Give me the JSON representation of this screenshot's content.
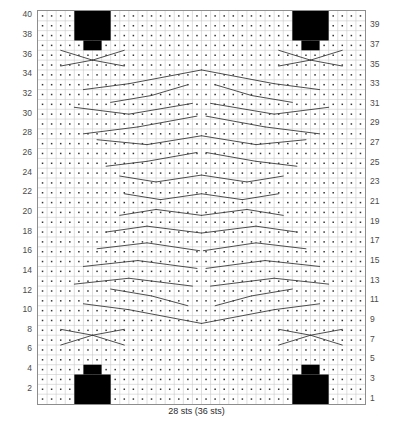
{
  "chart_data": {
    "type": "table",
    "caption": "28 sts (36 sts)",
    "columns": 36,
    "rows": 40,
    "grid": true,
    "xlabel": "",
    "ylabel": "",
    "cell_symbol": "purl-dot",
    "row_numbers_left": [
      40,
      38,
      36,
      34,
      32,
      30,
      28,
      26,
      24,
      22,
      20,
      18,
      16,
      14,
      12,
      10,
      8,
      6,
      4,
      2
    ],
    "row_numbers_right": [
      39,
      37,
      35,
      33,
      31,
      29,
      27,
      25,
      23,
      21,
      19,
      17,
      15,
      13,
      11,
      9,
      7,
      5,
      3,
      1
    ],
    "legend": [],
    "colors": {
      "grid_line": "#c9c9c9",
      "grid_border": "#8d8d8d",
      "dot": "#333333",
      "cable_line": "#3a3a3a",
      "block_fill": "#000000",
      "number_text": "#4a4a4a"
    },
    "blocks": [
      {
        "name": "top-left-bobble",
        "col": 4,
        "row": 37,
        "w": 4,
        "h": 3,
        "stem_col": 5,
        "stem_w": 2,
        "stem_h": 1,
        "orientation": "down"
      },
      {
        "name": "top-right-bobble",
        "col": 28,
        "row": 37,
        "w": 4,
        "h": 3,
        "stem_col": 29,
        "stem_w": 2,
        "stem_h": 1,
        "orientation": "down"
      },
      {
        "name": "bottom-left-bobble",
        "col": 4,
        "row": 1,
        "w": 4,
        "h": 3,
        "stem_col": 5,
        "stem_w": 2,
        "stem_h": 1,
        "orientation": "up"
      },
      {
        "name": "bottom-right-bobble",
        "col": 28,
        "row": 1,
        "w": 4,
        "h": 3,
        "stem_col": 29,
        "stem_w": 2,
        "stem_h": 1,
        "orientation": "up"
      }
    ],
    "cable_lines": [
      {
        "x1": 6.0,
        "y1": 36.0,
        "x2": 2.5,
        "y2": 37.0
      },
      {
        "x1": 6.0,
        "y1": 36.0,
        "x2": 9.5,
        "y2": 37.0
      },
      {
        "x1": 6.0,
        "y1": 36.0,
        "x2": 2.5,
        "y2": 35.4
      },
      {
        "x1": 6.0,
        "y1": 36.0,
        "x2": 9.5,
        "y2": 35.4
      },
      {
        "x1": 30.0,
        "y1": 36.0,
        "x2": 26.5,
        "y2": 37.0
      },
      {
        "x1": 30.0,
        "y1": 36.0,
        "x2": 33.5,
        "y2": 37.0
      },
      {
        "x1": 30.0,
        "y1": 36.0,
        "x2": 26.5,
        "y2": 35.4
      },
      {
        "x1": 30.0,
        "y1": 36.0,
        "x2": 33.5,
        "y2": 35.4
      },
      {
        "x1": 18.0,
        "y1": 35.0,
        "x2": 10.0,
        "y2": 33.6
      },
      {
        "x1": 10.0,
        "y1": 33.6,
        "x2": 5.0,
        "y2": 33.0
      },
      {
        "x1": 18.0,
        "y1": 35.0,
        "x2": 26.0,
        "y2": 33.6
      },
      {
        "x1": 26.0,
        "y1": 33.6,
        "x2": 31.0,
        "y2": 33.0
      },
      {
        "x1": 19.5,
        "y1": 33.5,
        "x2": 23.5,
        "y2": 32.4
      },
      {
        "x1": 23.5,
        "y1": 32.4,
        "x2": 28.0,
        "y2": 31.7
      },
      {
        "x1": 16.5,
        "y1": 33.5,
        "x2": 12.5,
        "y2": 32.4
      },
      {
        "x1": 12.5,
        "y1": 32.4,
        "x2": 8.0,
        "y2": 31.7
      },
      {
        "x1": 17.0,
        "y1": 31.6,
        "x2": 10.0,
        "y2": 30.5
      },
      {
        "x1": 10.0,
        "y1": 30.5,
        "x2": 4.0,
        "y2": 31.2
      },
      {
        "x1": 19.0,
        "y1": 31.6,
        "x2": 26.0,
        "y2": 30.5
      },
      {
        "x1": 26.0,
        "y1": 30.5,
        "x2": 32.0,
        "y2": 31.2
      },
      {
        "x1": 17.5,
        "y1": 30.3,
        "x2": 11.0,
        "y2": 29.2
      },
      {
        "x1": 11.0,
        "y1": 29.2,
        "x2": 5.0,
        "y2": 28.5
      },
      {
        "x1": 18.5,
        "y1": 30.3,
        "x2": 25.0,
        "y2": 29.2
      },
      {
        "x1": 25.0,
        "y1": 29.2,
        "x2": 31.0,
        "y2": 28.5
      },
      {
        "x1": 18.0,
        "y1": 28.3,
        "x2": 12.0,
        "y2": 27.4
      },
      {
        "x1": 12.0,
        "y1": 27.4,
        "x2": 6.5,
        "y2": 27.9
      },
      {
        "x1": 18.0,
        "y1": 28.3,
        "x2": 24.0,
        "y2": 27.4
      },
      {
        "x1": 24.0,
        "y1": 27.4,
        "x2": 29.5,
        "y2": 27.9
      },
      {
        "x1": 17.5,
        "y1": 26.6,
        "x2": 12.0,
        "y2": 25.7
      },
      {
        "x1": 12.0,
        "y1": 25.7,
        "x2": 7.5,
        "y2": 25.2
      },
      {
        "x1": 18.5,
        "y1": 26.6,
        "x2": 24.0,
        "y2": 25.7
      },
      {
        "x1": 24.0,
        "y1": 25.7,
        "x2": 28.5,
        "y2": 25.2
      },
      {
        "x1": 18.0,
        "y1": 24.3,
        "x2": 13.0,
        "y2": 23.6
      },
      {
        "x1": 13.0,
        "y1": 23.6,
        "x2": 9.0,
        "y2": 24.2
      },
      {
        "x1": 18.0,
        "y1": 24.3,
        "x2": 23.0,
        "y2": 23.6
      },
      {
        "x1": 23.0,
        "y1": 23.6,
        "x2": 27.0,
        "y2": 24.2
      },
      {
        "x1": 18.0,
        "y1": 22.4,
        "x2": 13.5,
        "y2": 21.8
      },
      {
        "x1": 13.5,
        "y1": 21.8,
        "x2": 9.5,
        "y2": 22.4
      },
      {
        "x1": 18.0,
        "y1": 22.4,
        "x2": 22.5,
        "y2": 21.8
      },
      {
        "x1": 22.5,
        "y1": 21.8,
        "x2": 26.5,
        "y2": 22.4
      },
      {
        "x1": 18.0,
        "y1": 20.2,
        "x2": 13.0,
        "y2": 20.8
      },
      {
        "x1": 13.0,
        "y1": 20.8,
        "x2": 9.0,
        "y2": 20.2
      },
      {
        "x1": 18.0,
        "y1": 20.2,
        "x2": 23.0,
        "y2": 20.8
      },
      {
        "x1": 23.0,
        "y1": 20.8,
        "x2": 27.0,
        "y2": 20.2
      },
      {
        "x1": 18.0,
        "y1": 18.4,
        "x2": 12.0,
        "y2": 19.1
      },
      {
        "x1": 12.0,
        "y1": 19.1,
        "x2": 7.5,
        "y2": 18.5
      },
      {
        "x1": 18.0,
        "y1": 18.4,
        "x2": 24.0,
        "y2": 19.1
      },
      {
        "x1": 24.0,
        "y1": 19.1,
        "x2": 28.5,
        "y2": 18.5
      },
      {
        "x1": 17.8,
        "y1": 16.6,
        "x2": 12.0,
        "y2": 17.4
      },
      {
        "x1": 12.0,
        "y1": 17.4,
        "x2": 6.5,
        "y2": 16.8
      },
      {
        "x1": 18.2,
        "y1": 16.6,
        "x2": 24.0,
        "y2": 17.4
      },
      {
        "x1": 24.0,
        "y1": 17.4,
        "x2": 29.5,
        "y2": 16.8
      },
      {
        "x1": 17.5,
        "y1": 14.8,
        "x2": 11.0,
        "y2": 15.6
      },
      {
        "x1": 11.0,
        "y1": 15.6,
        "x2": 5.0,
        "y2": 15.0
      },
      {
        "x1": 18.5,
        "y1": 14.8,
        "x2": 25.0,
        "y2": 15.6
      },
      {
        "x1": 25.0,
        "y1": 15.6,
        "x2": 31.0,
        "y2": 15.0
      },
      {
        "x1": 17.0,
        "y1": 13.0,
        "x2": 10.0,
        "y2": 13.8
      },
      {
        "x1": 10.0,
        "y1": 13.8,
        "x2": 4.0,
        "y2": 13.2
      },
      {
        "x1": 19.0,
        "y1": 13.0,
        "x2": 26.0,
        "y2": 13.8
      },
      {
        "x1": 26.0,
        "y1": 13.8,
        "x2": 32.0,
        "y2": 13.2
      },
      {
        "x1": 16.5,
        "y1": 11.0,
        "x2": 12.5,
        "y2": 12.0
      },
      {
        "x1": 12.5,
        "y1": 12.0,
        "x2": 8.0,
        "y2": 12.7
      },
      {
        "x1": 19.5,
        "y1": 11.0,
        "x2": 23.5,
        "y2": 12.0
      },
      {
        "x1": 23.5,
        "y1": 12.0,
        "x2": 28.0,
        "y2": 12.7
      },
      {
        "x1": 18.0,
        "y1": 9.2,
        "x2": 10.0,
        "y2": 10.6
      },
      {
        "x1": 10.0,
        "y1": 10.6,
        "x2": 5.0,
        "y2": 11.2
      },
      {
        "x1": 18.0,
        "y1": 9.2,
        "x2": 26.0,
        "y2": 10.6
      },
      {
        "x1": 26.0,
        "y1": 10.6,
        "x2": 31.0,
        "y2": 11.2
      },
      {
        "x1": 6.0,
        "y1": 8.0,
        "x2": 2.5,
        "y2": 7.0
      },
      {
        "x1": 6.0,
        "y1": 8.0,
        "x2": 9.5,
        "y2": 7.0
      },
      {
        "x1": 6.0,
        "y1": 8.0,
        "x2": 2.5,
        "y2": 8.6
      },
      {
        "x1": 6.0,
        "y1": 8.0,
        "x2": 9.5,
        "y2": 8.6
      },
      {
        "x1": 30.0,
        "y1": 8.0,
        "x2": 26.5,
        "y2": 7.0
      },
      {
        "x1": 30.0,
        "y1": 8.0,
        "x2": 33.5,
        "y2": 7.0
      },
      {
        "x1": 30.0,
        "y1": 8.0,
        "x2": 26.5,
        "y2": 8.6
      },
      {
        "x1": 30.0,
        "y1": 8.0,
        "x2": 33.5,
        "y2": 8.6
      }
    ]
  }
}
